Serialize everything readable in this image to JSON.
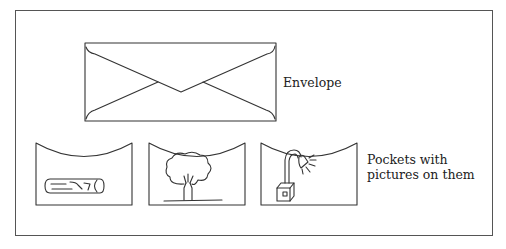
{
  "diagram": {
    "envelope": {
      "label": "Envelope",
      "icon": "envelope-icon"
    },
    "pockets": {
      "label": "Pockets with pictures on them",
      "items": [
        {
          "picture": "log-icon"
        },
        {
          "picture": "tree-icon"
        },
        {
          "picture": "lamp-icon"
        }
      ]
    },
    "colors": {
      "stroke": "#333333",
      "frame": "#555555",
      "background": "#ffffff"
    }
  }
}
